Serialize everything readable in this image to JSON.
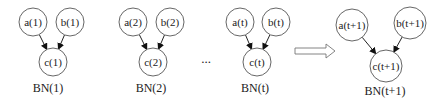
{
  "diagram": {
    "networks": [
      {
        "label": "BN(1)",
        "label_pos": [
          48,
          92
        ],
        "nodes": [
          {
            "id": "a",
            "text": "a(1)",
            "cx": 33,
            "cy": 22,
            "r": 14
          },
          {
            "id": "b",
            "text": "b(1)",
            "cx": 70,
            "cy": 22,
            "r": 14
          },
          {
            "id": "c",
            "text": "c(1)",
            "cx": 53,
            "cy": 62,
            "r": 14
          }
        ]
      },
      {
        "label": "BN(2)",
        "label_pos": [
          151,
          92
        ],
        "nodes": [
          {
            "id": "a",
            "text": "a(2)",
            "cx": 133,
            "cy": 22,
            "r": 14
          },
          {
            "id": "b",
            "text": "b(2)",
            "cx": 170,
            "cy": 22,
            "r": 14
          },
          {
            "id": "c",
            "text": "c(2)",
            "cx": 153,
            "cy": 62,
            "r": 14
          }
        ]
      },
      {
        "label": "BN(t)",
        "label_pos": [
          255,
          92
        ],
        "nodes": [
          {
            "id": "a",
            "text": "a(t)",
            "cx": 240,
            "cy": 22,
            "r": 14
          },
          {
            "id": "b",
            "text": "b(t)",
            "cx": 276,
            "cy": 22,
            "r": 14
          },
          {
            "id": "c",
            "text": "c(t)",
            "cx": 257,
            "cy": 62,
            "r": 14
          }
        ]
      },
      {
        "label": "BN(t+1)",
        "label_pos": [
          385,
          95
        ],
        "nodes": [
          {
            "id": "a",
            "text": "a(t+1)",
            "cx": 352,
            "cy": 25,
            "r": 16
          },
          {
            "id": "b",
            "text": "b(t+1)",
            "cx": 410,
            "cy": 23,
            "r": 16
          },
          {
            "id": "c",
            "text": "c(t+1)",
            "cx": 386,
            "cy": 66,
            "r": 16
          }
        ]
      }
    ],
    "edges": [
      [
        "a",
        "c"
      ],
      [
        "b",
        "c"
      ]
    ],
    "ellipsis": "...",
    "ellipsis_pos": [
      206,
      63
    ],
    "transition_arrow": {
      "x1": 295,
      "x2": 335,
      "y": 51
    }
  }
}
